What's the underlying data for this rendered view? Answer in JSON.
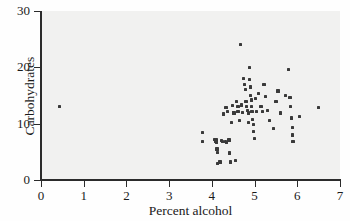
{
  "figure": {
    "background_color": "#f1f1f0",
    "point_color": "#3a3a3a",
    "axis_color": "#2b2b2b"
  },
  "chart_data": {
    "type": "scatter",
    "title": "",
    "xlabel": "Percent alcohol",
    "ylabel": "Carbohydrates",
    "xlim": [
      0,
      7
    ],
    "ylim": [
      0,
      30
    ],
    "xticks": [
      0,
      1,
      2,
      3,
      4,
      5,
      6,
      7
    ],
    "yticks": [
      0,
      10,
      20,
      30
    ],
    "xtick_labels": [
      "0",
      "1",
      "2",
      "3",
      "4",
      "5",
      "6",
      "7"
    ],
    "ytick_labels": [
      "0",
      "10",
      "20",
      "30"
    ],
    "grid": false,
    "legend": null,
    "marker": "square",
    "points": [
      [
        0.44,
        13.0
      ],
      [
        3.78,
        8.4
      ],
      [
        3.79,
        6.8
      ],
      [
        4.06,
        7.2
      ],
      [
        4.08,
        6.9
      ],
      [
        4.1,
        6.6
      ],
      [
        4.11,
        7.1
      ],
      [
        4.12,
        5.5
      ],
      [
        4.13,
        4.9
      ],
      [
        4.14,
        3.0
      ],
      [
        4.19,
        3.2
      ],
      [
        4.22,
        7.0
      ],
      [
        4.25,
        6.8
      ],
      [
        4.28,
        11.7
      ],
      [
        4.31,
        6.9
      ],
      [
        4.33,
        12.9
      ],
      [
        4.35,
        6.7
      ],
      [
        4.37,
        12.2
      ],
      [
        4.4,
        7.1
      ],
      [
        4.41,
        4.8
      ],
      [
        4.43,
        3.2
      ],
      [
        4.46,
        10.2
      ],
      [
        4.48,
        13.2
      ],
      [
        4.5,
        12.0
      ],
      [
        4.52,
        11.9
      ],
      [
        4.55,
        3.5
      ],
      [
        4.57,
        13.9
      ],
      [
        4.6,
        12.1
      ],
      [
        4.61,
        13.1
      ],
      [
        4.63,
        12.2
      ],
      [
        4.65,
        10.6
      ],
      [
        4.67,
        24.0
      ],
      [
        4.7,
        13.3
      ],
      [
        4.72,
        12.0
      ],
      [
        4.74,
        18.0
      ],
      [
        4.76,
        17.0
      ],
      [
        4.78,
        16.1
      ],
      [
        4.8,
        14.0
      ],
      [
        4.81,
        13.0
      ],
      [
        4.83,
        12.3
      ],
      [
        4.85,
        11.9
      ],
      [
        4.86,
        10.2
      ],
      [
        4.88,
        20.0
      ],
      [
        4.89,
        17.9
      ],
      [
        4.9,
        16.5
      ],
      [
        4.91,
        15.0
      ],
      [
        4.92,
        14.2
      ],
      [
        4.93,
        13.1
      ],
      [
        4.94,
        12.2
      ],
      [
        4.96,
        10.8
      ],
      [
        4.97,
        9.9
      ],
      [
        4.98,
        8.6
      ],
      [
        5.0,
        7.3
      ],
      [
        5.02,
        14.5
      ],
      [
        5.05,
        12.2
      ],
      [
        5.1,
        15.3
      ],
      [
        5.15,
        13.0
      ],
      [
        5.18,
        12.2
      ],
      [
        5.22,
        17.0
      ],
      [
        5.25,
        14.8
      ],
      [
        5.3,
        12.4
      ],
      [
        5.35,
        10.6
      ],
      [
        5.45,
        9.2
      ],
      [
        5.5,
        13.9
      ],
      [
        5.55,
        15.8
      ],
      [
        5.6,
        11.9
      ],
      [
        5.72,
        15.0
      ],
      [
        5.8,
        19.6
      ],
      [
        5.83,
        14.6
      ],
      [
        5.85,
        13.0
      ],
      [
        5.87,
        11.0
      ],
      [
        5.88,
        9.3
      ],
      [
        5.89,
        8.0
      ],
      [
        5.9,
        6.9
      ],
      [
        6.05,
        11.3
      ],
      [
        6.5,
        12.9
      ]
    ]
  }
}
